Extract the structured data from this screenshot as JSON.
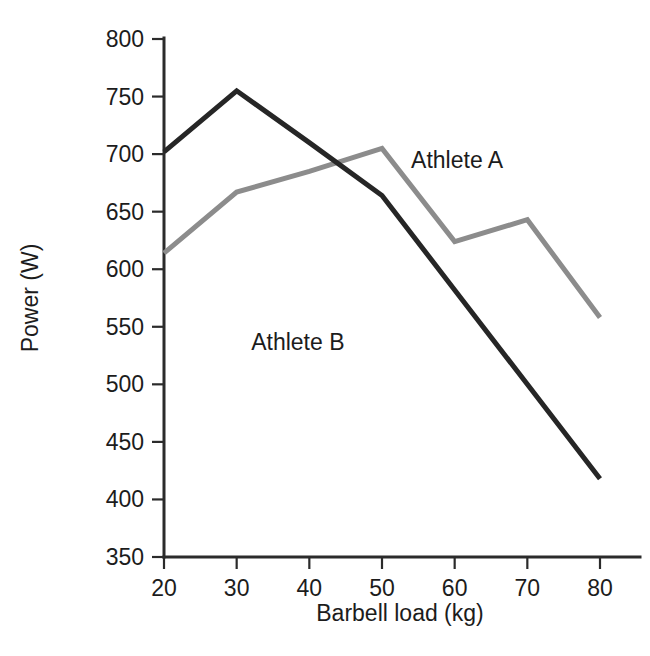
{
  "chart_data": {
    "type": "line",
    "title": "",
    "xlabel": "Barbell load (kg)",
    "ylabel": "Power (W)",
    "x": [
      20,
      30,
      40,
      50,
      60,
      70,
      80
    ],
    "xticklabels": [
      "20",
      "30",
      "40",
      "50",
      "60",
      "70",
      "80"
    ],
    "yticklabels": [
      "350",
      "400",
      "450",
      "500",
      "550",
      "600",
      "650",
      "700",
      "750",
      "800"
    ],
    "yticks": [
      350,
      400,
      450,
      500,
      550,
      600,
      650,
      700,
      750,
      800
    ],
    "xlim": [
      15,
      85
    ],
    "ylim": [
      350,
      800
    ],
    "grid": false,
    "legend_position": "inline-annotations",
    "series": [
      {
        "name": "Athlete A",
        "color": "#8c8c8c",
        "linewidth": 5,
        "values": [
          614,
          667,
          685,
          705,
          624,
          643,
          558
        ],
        "label_text": "Athlete A",
        "label_x": 54,
        "label_y": 688
      },
      {
        "name": "Athlete B",
        "color": "#262626",
        "linewidth": 5,
        "values": [
          702,
          755,
          710,
          664,
          582,
          500,
          418
        ],
        "label_text": "Athlete B",
        "label_x": 32,
        "label_y": 530
      }
    ]
  },
  "axes": {
    "y_axis_title": "Power (W)",
    "x_axis_title": "Barbell load (kg)"
  }
}
